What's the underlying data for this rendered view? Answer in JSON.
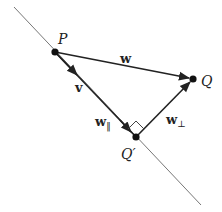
{
  "diagram": {
    "colors": {
      "line": "#777777",
      "vector": "#222222",
      "point": "#111111",
      "background": "#ffffff"
    },
    "line": {
      "x1": 14,
      "y1": 7,
      "x2": 201,
      "y2": 205
    },
    "points": {
      "P": {
        "label": "P",
        "x": 55,
        "y": 52
      },
      "Q": {
        "label": "Q",
        "x": 193,
        "y": 79
      },
      "Qp": {
        "label": "Q′",
        "x": 136,
        "y": 137
      }
    },
    "vectors": {
      "w": {
        "label": "w",
        "sub": ""
      },
      "v": {
        "label": "v",
        "sub": ""
      },
      "w_par": {
        "label": "w",
        "sub": "‖"
      },
      "w_perp": {
        "label": "w",
        "sub": "⊥"
      }
    },
    "annotations": {
      "right_angle": "right-angle-marker at Q′"
    }
  }
}
